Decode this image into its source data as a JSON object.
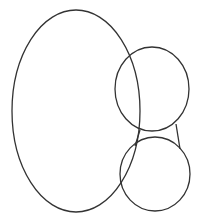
{
  "diagram": {
    "background": "#ffffff",
    "stroke": "#333333",
    "stroke_width": 1.3,
    "shapes": [
      {
        "id": "large-ellipse",
        "type": "ellipse",
        "cx": 76,
        "cy": 111,
        "rx": 64,
        "ry": 101
      },
      {
        "id": "top-circle",
        "type": "ellipse",
        "cx": 152,
        "cy": 89,
        "rx": 37,
        "ry": 42
      },
      {
        "id": "bottom-circle",
        "type": "ellipse",
        "cx": 155,
        "cy": 174,
        "rx": 35,
        "ry": 37
      }
    ],
    "connectors": [
      {
        "id": "right-connector",
        "x1": 176,
        "y1": 124,
        "x2": 180,
        "y2": 149
      },
      {
        "id": "left-connector",
        "x1": 140,
        "y1": 130,
        "x2": 135,
        "y2": 146
      }
    ]
  }
}
